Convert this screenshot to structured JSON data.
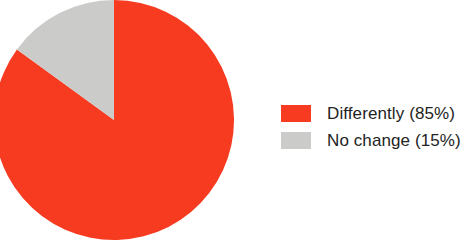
{
  "chart_data": {
    "type": "pie",
    "title": "",
    "subtitle": "",
    "xlabel": "",
    "ylabel": "",
    "grid": false,
    "legend_position": "right",
    "start_angle_deg": 0,
    "direction": "clockwise",
    "categories": [
      "Differently",
      "No change"
    ],
    "values": [
      85,
      15
    ],
    "units": "percent",
    "slices": [
      {
        "label": "Differently",
        "value": 85,
        "value_text": "85%",
        "legend_text": "Differently (85%)",
        "color": "#f73b20",
        "start_deg": 0,
        "end_deg": 306
      },
      {
        "label": "No change",
        "value": 15,
        "value_text": "15%",
        "legend_text": "No change (15%)",
        "color": "#cbcbc9",
        "start_deg": 306,
        "end_deg": 360
      }
    ],
    "annotations": []
  },
  "legend": {
    "items": [
      {
        "label": "Differently (85%)",
        "color": "#f73b20",
        "swatch_name": "legend-swatch-differently"
      },
      {
        "label": "No change (15%)",
        "color": "#cbcbc9",
        "swatch_name": "legend-swatch-no-change"
      }
    ]
  },
  "colors": {
    "background": "#ffffff",
    "text": "#232323",
    "series_differently": "#f73b20",
    "series_no_change": "#cbcbc9"
  }
}
